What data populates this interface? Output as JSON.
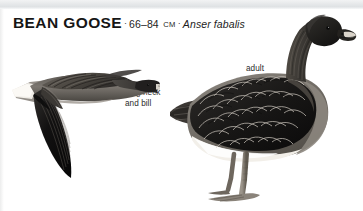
{
  "page": {
    "background_color": "#ffffff",
    "band_color": "#e6e8ea",
    "ink_color": "#1a1a1a"
  },
  "heading": {
    "species_name": "BEAN GOOSE",
    "separator": "·",
    "size_range": "66–84",
    "size_unit": "CM",
    "scientific_name": "Anser fabalis"
  },
  "annotations": {
    "long_neck_line1": "long neck",
    "long_neck_line2": "and bill",
    "adult": "adult"
  },
  "illustrations": {
    "flying": {
      "caption_ref": "long neck and bill",
      "pose": "flying-right",
      "plumage": {
        "head": "#2a2a2a",
        "neck": "#3b3b3b",
        "body": "#6e6a64",
        "wing": "#141414",
        "belly": "#e9e6e0",
        "bill": "#efece6"
      }
    },
    "standing": {
      "caption_ref": "adult",
      "pose": "standing-right",
      "plumage": {
        "head": "#272625",
        "neck": "#3a3835",
        "body": "#7b7771",
        "wing": "#1b1a19",
        "flank": "#f1efe9",
        "leg": "#8c857c",
        "bill_tip": "#d8d2c8"
      }
    }
  }
}
